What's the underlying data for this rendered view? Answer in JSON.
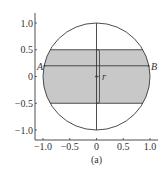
{
  "figure": {
    "caption": "(a)",
    "x_ticks": [
      "−1.0",
      "−0.5",
      "0",
      "0.5",
      "1.0"
    ],
    "y_ticks": [
      "1.0",
      "0.5",
      "0",
      "−0.5",
      "−1.0"
    ],
    "labels": {
      "A": "A",
      "B": "B",
      "r": "r"
    },
    "colors": {
      "shaded_band": "#c8c8c8",
      "stroke": "#3a3a3a"
    }
  }
}
